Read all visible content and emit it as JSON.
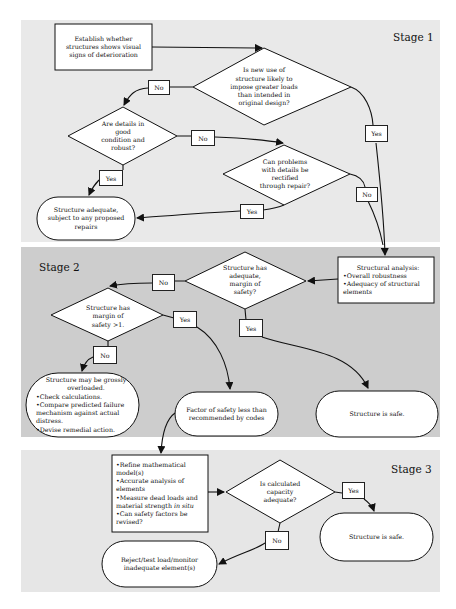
{
  "stages": {
    "stage1": "Stage 1",
    "stage2": "Stage 2",
    "stage3": "Stage 3"
  },
  "nodes": {
    "establish": [
      "Establish whether",
      "structures shows visual",
      "signs of deterioration"
    ],
    "new_use": [
      "Is new use of",
      "structure likely to",
      "impose greater loads",
      "than intended in",
      "original design?"
    ],
    "details_good": [
      "Are details in",
      "good",
      "condition and",
      "robust?"
    ],
    "rectify": [
      "Can problems",
      "with details be",
      "rectified",
      "through repair?"
    ],
    "adequate_repairs": [
      "Structure adequate,",
      "subject to any proposed",
      "repairs"
    ],
    "structural_analysis": {
      "title": "Structural analysis:",
      "bullets": [
        "•Overall robustness",
        "•Adequacy of structural",
        "elements"
      ]
    },
    "adequate_margin": [
      "Structure has",
      "adequate,",
      "margin of",
      "safety?"
    ],
    "margin_gt1": [
      "Structure has",
      "margin of",
      "safety >1."
    ],
    "overloaded": {
      "title": [
        "Structure may be grossly",
        "overloaded."
      ],
      "bullets": [
        "•Check calculations.",
        "•Compare predicted failure",
        "mechanism against actual",
        "distress.",
        "•Devise remedial action."
      ]
    },
    "factor_less": [
      "Factor of safety less than",
      "recommended by codes"
    ],
    "safe2": "Structure is safe.",
    "refine": {
      "lines": [
        "•Refine mathematical",
        "model(s)",
        "•Accurate analysis of",
        "elements",
        "•Measure dead loads and"
      ],
      "strength_prefix": "material strength ",
      "strength_em": "in situ",
      "tail": [
        "•Can safety factors be",
        "revised?"
      ]
    },
    "capacity": [
      "Is calculated",
      "capacity",
      "adequate?"
    ],
    "safe3": "Structure is safe.",
    "reject": [
      "Reject/test load/monitor",
      "inadequate element(s)"
    ]
  },
  "edge_labels": {
    "new_use_no": "No",
    "new_use_yes": "Yes",
    "details_no": "No",
    "details_yes": "Yes",
    "rectify_no": "No",
    "rectify_yes": "Yes",
    "margin_no": "No",
    "margin_yes": "Yes",
    "gt1_yes": "Yes",
    "gt1_no": "No",
    "capacity_yes": "Yes",
    "capacity_no": "No"
  },
  "colors": {
    "stage1_bg": "#e9e9e9",
    "stage2_bg": "#cdcdcd",
    "stage3_bg": "#e6e6e6",
    "node_fill": "#ffffff",
    "stroke": "#111111"
  }
}
